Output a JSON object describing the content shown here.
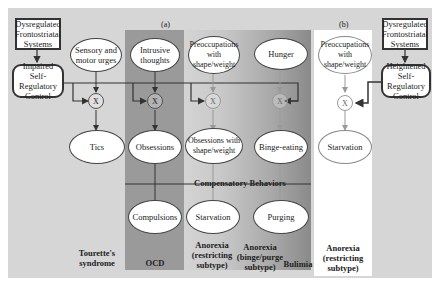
{
  "panels": {
    "a_label": "(a)",
    "b_label": "(b)"
  },
  "left_source": {
    "box": "Dysregulated Frontostriatal Systems",
    "control": "Impaired Self-Regulatory Control"
  },
  "right_source": {
    "box": "Dysregulated Frontostriatal Systems",
    "control": "Heightened Self-Regulatory Control"
  },
  "multiply_symbol": "X",
  "columns": [
    {
      "input": "Sensory and motor urges",
      "output": "Tics",
      "disorder": "Tourette's syndrome"
    },
    {
      "input": "Intrusive thoughts",
      "output": "Obsessions",
      "compensatory": "Compulsions",
      "disorder": "OCD"
    },
    {
      "input": "Preoccupations with shape/weight",
      "output": "Obsessions with shape/weight",
      "compensatory": "Starvation",
      "disorder": "Anorexia (restricting subtype)"
    },
    {
      "input": "Hunger",
      "output": "Binge-eating",
      "compensatory": "Purging",
      "disorder_left": "Anorexia (binge/purge subtype)",
      "disorder": "Bulimia"
    }
  ],
  "compensatory_header": "Compensatory Behaviors",
  "panel_b": {
    "input": "Preoccupations with shape/weight",
    "output": "Starvation",
    "disorder": "Anorexia (restricting subtype)"
  },
  "colors": {
    "background": "#d6d6d6",
    "ocd_column": "#9a9a9a",
    "panel_b_column": "#ffffff",
    "line": "#333333"
  }
}
